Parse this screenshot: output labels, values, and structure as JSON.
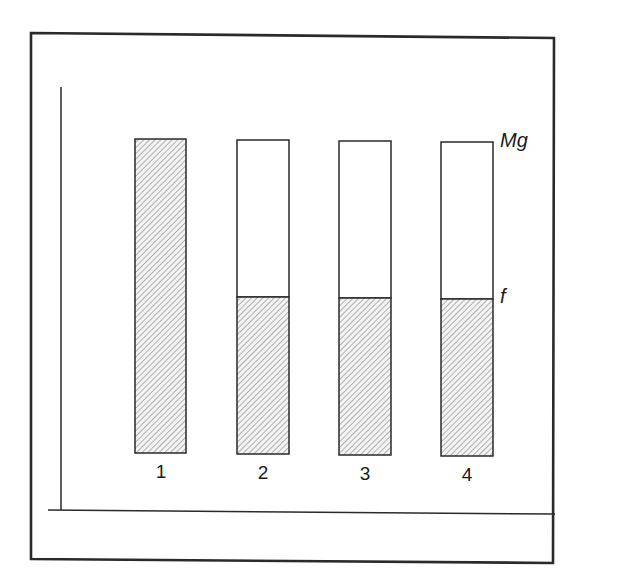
{
  "figure": {
    "labels": {
      "top_level": "Mg",
      "mid_level": "f"
    },
    "bars": [
      {
        "label": "1",
        "total": 1.0,
        "hatched_fraction": 1.0
      },
      {
        "label": "2",
        "total": 1.0,
        "hatched_fraction": 0.5
      },
      {
        "label": "3",
        "total": 1.0,
        "hatched_fraction": 0.5
      },
      {
        "label": "4",
        "total": 1.0,
        "hatched_fraction": 0.5
      }
    ],
    "colors": {
      "stroke": "#2a2a2a",
      "hatch": "#8a8a8a",
      "background": "#ffffff"
    }
  }
}
